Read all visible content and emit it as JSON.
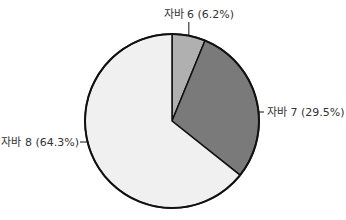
{
  "chart_data": {
    "type": "pie",
    "title": "",
    "start_angle": "12 o'clock, clockwise",
    "categories": [
      "자바 6",
      "자바 7",
      "자바 8"
    ],
    "values": [
      6.2,
      29.5,
      64.3
    ],
    "unit": "%",
    "labels": [
      "자바 6 (6.2%)",
      "자바 7 (29.5%)",
      "자바 8 (64.3%)"
    ],
    "colors": [
      "#b0b0b0",
      "#7a7a7a",
      "#f0f0f0"
    ],
    "legend": "none (leader-line labels)"
  },
  "geometry": {
    "cx": 172,
    "cy": 121,
    "r": 87
  }
}
